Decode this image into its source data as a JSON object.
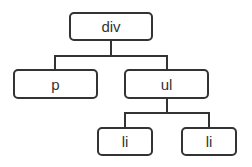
{
  "diagram": {
    "type": "tree",
    "colors": {
      "stroke": "#333333",
      "background": "#ffffff",
      "text": "#333333"
    },
    "nodes": [
      {
        "id": "div",
        "label": "div",
        "parent": null
      },
      {
        "id": "p",
        "label": "p",
        "parent": "div"
      },
      {
        "id": "ul",
        "label": "ul",
        "parent": "div"
      },
      {
        "id": "li1",
        "label": "li",
        "parent": "ul"
      },
      {
        "id": "li2",
        "label": "li",
        "parent": "ul"
      }
    ]
  }
}
